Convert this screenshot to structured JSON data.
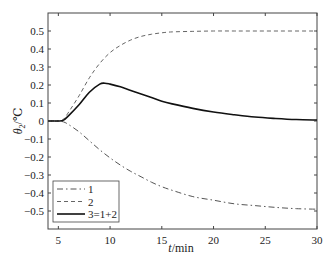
{
  "chart_data": {
    "type": "line",
    "title": "",
    "xlabel": "t/min",
    "ylabel": "θ2/℃",
    "xlim": [
      4,
      30
    ],
    "ylim": [
      -0.6,
      0.6
    ],
    "xticks": [
      5,
      10,
      15,
      20,
      25,
      30
    ],
    "yticks": [
      0.5,
      0.4,
      0.3,
      0.2,
      0.1,
      0,
      -0.1,
      -0.2,
      -0.3,
      -0.4,
      -0.5
    ],
    "ytick_labels": [
      "0.5",
      "0.4",
      "0.3",
      "0.2",
      "0.1",
      "0",
      "−0.1",
      "−0.2",
      "−0.3",
      "−0.4",
      "−0.5"
    ],
    "grid": false,
    "legend_position": "lower left",
    "series": [
      {
        "name": "1",
        "style": "dash-dot",
        "color": "#555555",
        "x": [
          4,
          5,
          5.5,
          6,
          7,
          8,
          9,
          10,
          11,
          12,
          13,
          14,
          15,
          16,
          18,
          20,
          22,
          24,
          26,
          28,
          30
        ],
        "y": [
          0,
          0,
          -0.005,
          -0.02,
          -0.06,
          -0.11,
          -0.16,
          -0.205,
          -0.245,
          -0.28,
          -0.31,
          -0.34,
          -0.365,
          -0.385,
          -0.42,
          -0.44,
          -0.46,
          -0.47,
          -0.48,
          -0.487,
          -0.49
        ]
      },
      {
        "name": "2",
        "style": "dashed",
        "color": "#666666",
        "x": [
          4,
          5,
          5.5,
          6,
          7,
          8,
          9,
          10,
          11,
          12,
          13,
          14,
          15,
          16,
          18,
          20,
          22,
          25,
          30
        ],
        "y": [
          0,
          0,
          0.01,
          0.05,
          0.14,
          0.24,
          0.32,
          0.38,
          0.42,
          0.45,
          0.47,
          0.482,
          0.49,
          0.495,
          0.498,
          0.5,
          0.5,
          0.5,
          0.5
        ]
      },
      {
        "name": "3=1+2",
        "style": "solid",
        "color": "#111111",
        "x": [
          4,
          5,
          5.5,
          6,
          7,
          8,
          9,
          9.5,
          10,
          11,
          12,
          13,
          14,
          15,
          16,
          18,
          20,
          22,
          24,
          26,
          28,
          30
        ],
        "y": [
          0,
          0,
          0.005,
          0.03,
          0.09,
          0.16,
          0.205,
          0.21,
          0.205,
          0.19,
          0.17,
          0.15,
          0.13,
          0.11,
          0.095,
          0.07,
          0.05,
          0.035,
          0.022,
          0.014,
          0.008,
          0.005
        ]
      }
    ]
  },
  "legend": {
    "items": [
      "1",
      "2",
      "3=1+2"
    ]
  },
  "axes": {
    "xlabel_italic": "t",
    "xlabel_unit": "/min",
    "ylabel_symbol": "θ",
    "ylabel_sub": "2",
    "ylabel_unit": "/℃"
  }
}
